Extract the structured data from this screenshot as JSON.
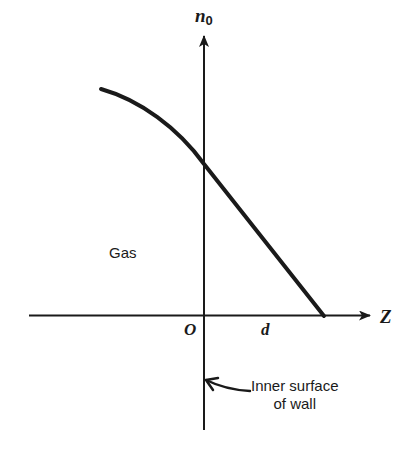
{
  "diagram": {
    "title": "",
    "y_axis": {
      "symbol": "n",
      "subscript": "0"
    },
    "x_axis": {
      "symbol": "Z"
    },
    "origin_label": "O",
    "distance_label": "d",
    "region_label": "Gas",
    "annotation": {
      "line1": "Inner surface",
      "line2": "of wall",
      "points_to": "vertical axis (inner wall surface at Z = 0)"
    },
    "curve": {
      "description": "Concentration n0 decreasing from gas region through wall, reaching zero at Z = d",
      "color": "#1a1a1a"
    },
    "colors": {
      "ink": "#1a1a1a",
      "background": "#ffffff"
    }
  }
}
